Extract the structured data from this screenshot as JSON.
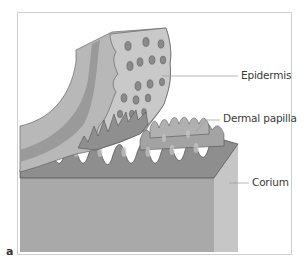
{
  "figure": {
    "panel_letter": "a",
    "labels": {
      "epidermis": "Epidermis",
      "dermal_papilla": "Dermal papilla",
      "corium": "Corium"
    },
    "colors": {
      "frame_border": "#cfcfcf",
      "corium_front": "#a9a9a9",
      "corium_side": "#c4c4c4",
      "papilla_fill": "#8e8e8e",
      "epidermis_outer": "#b8b8b8",
      "epidermis_band": "#9a9a9a",
      "epidermis_inner": "#c9c9c9",
      "leader_line": "#9a9a9a",
      "label_text": "#3a3a3a"
    }
  }
}
